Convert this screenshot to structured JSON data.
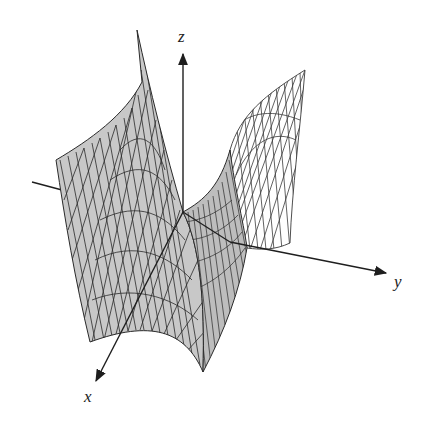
{
  "figure": {
    "surface": {
      "type": "saddle",
      "fill_color": "#c8c8c8",
      "mesh_color": "#2a2a2a",
      "back_wire_color": "#3a3a3a"
    },
    "axes": {
      "x": {
        "label": "x"
      },
      "y": {
        "label": "y"
      },
      "z": {
        "label": "z"
      },
      "color": "#1e1e1e"
    }
  }
}
